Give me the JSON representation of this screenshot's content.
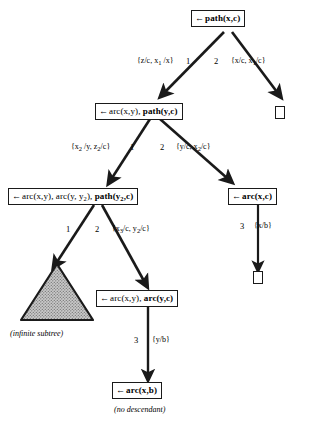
{
  "figure": {
    "type": "sld-resolution-tree",
    "nodes": [
      {
        "id": "n-root",
        "arrow": "←",
        "plain": "",
        "bold": "path(x,c)",
        "sub_bold": "",
        "label": "← path(x,c)"
      },
      {
        "id": "n-arc-path",
        "arrow": "←",
        "plain": "arc(x,y), ",
        "bold": "path(y,c)",
        "label": "←arc(x,y), path(y,c)"
      },
      {
        "id": "n-arc-arc-path",
        "arrow": "←",
        "plain": "arc(x,y), arc(y, y",
        "plain_sub": "2",
        "plain_tail": "), ",
        "bold": "path(y",
        "bold_sub": "2",
        "bold_tail": ",c)",
        "label": "←arc(x,y), arc(y, y2), path(y2,c)"
      },
      {
        "id": "n-arc-xc",
        "arrow": "←",
        "plain": "",
        "bold": "arc(x,c)",
        "label": "← arc(x,c)"
      },
      {
        "id": "n-arc-arc",
        "arrow": "←",
        "plain": "arc(x,y), ",
        "bold": "arc(y,c)",
        "label": "←arc(x,y), arc(y,c)"
      },
      {
        "id": "n-arc-xb",
        "arrow": "←",
        "plain": "",
        "bold": "arc(x,b)",
        "label": "← arc(x,b)"
      }
    ],
    "empty_boxes": [
      {
        "id": "box-right-1",
        "label": "□"
      },
      {
        "id": "box-right-2",
        "label": "□"
      }
    ],
    "edges": [
      {
        "id": "e1",
        "from": "n-root",
        "to": "n-arc-path",
        "number": "1",
        "substitution": "{z/c, x",
        "sub": "1",
        "substitution_tail": " /x}",
        "full": "{z/c, x1 /x}"
      },
      {
        "id": "e2",
        "from": "n-root",
        "to": "box-right-1",
        "number": "2",
        "substitution": "{x/c, x",
        "sub": "1",
        "substitution_tail": "/c}",
        "full": "{x/c, x1/c}"
      },
      {
        "id": "e3",
        "from": "n-arc-path",
        "to": "n-arc-arc-path",
        "number": "1",
        "substitution": "{x",
        "sub": "2",
        "substitution_tail": " /y, z",
        "sub2": "2",
        "substitution_tail2": "/c}",
        "full": "{x2 /y, z2 /c}"
      },
      {
        "id": "e4",
        "from": "n-arc-path",
        "to": "n-arc-xc",
        "number": "2",
        "substitution": "{y/c, x",
        "sub": "2",
        "substitution_tail": "/c}",
        "full": "{y/c, x2 /c}"
      },
      {
        "id": "e5",
        "from": "n-arc-arc-path",
        "to": "triangle-infinite",
        "number": "1",
        "substitution": "",
        "full": ""
      },
      {
        "id": "e6",
        "from": "n-arc-arc-path",
        "to": "n-arc-arc",
        "number": "2",
        "substitution": "{x",
        "sub": "3",
        "substitution_tail": "/c, y",
        "sub2": "2",
        "substitution_tail2": "/c}",
        "full": "{x3 /c, y2 /c}"
      },
      {
        "id": "e7",
        "from": "n-arc-xc",
        "to": "box-right-2",
        "number": "3",
        "substitution": "{x/b}",
        "full": "{x/b}"
      },
      {
        "id": "e8",
        "from": "n-arc-arc",
        "to": "n-arc-xb",
        "number": "3",
        "substitution": "{y/b}",
        "full": "{y/b}"
      }
    ],
    "captions": [
      {
        "id": "cap-infinite",
        "text": "(infinite subtree)"
      },
      {
        "id": "cap-no-descendant",
        "text": "(no descendant)"
      }
    ],
    "triangle": {
      "id": "triangle-infinite",
      "name": "infinite-subtree-triangle",
      "fill": "#b3b3b3",
      "stroke": "#1a1a1a"
    },
    "colors": {
      "stroke": "#1a1a1a",
      "background": "#ffffff",
      "text": "#000000",
      "triangle_fill": "#b3b3b3"
    }
  }
}
